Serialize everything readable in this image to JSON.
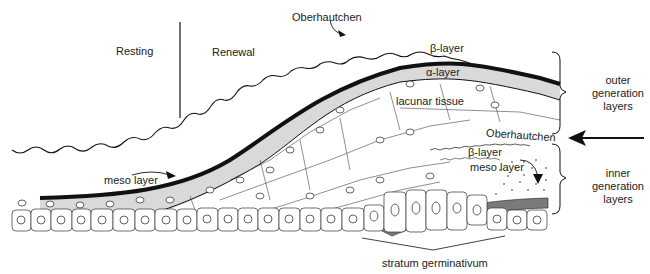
{
  "diagram": {
    "regions": {
      "resting": "Resting",
      "renewal": "Renewal"
    },
    "labels": {
      "oberhautchen_outer": "Oberhautchen",
      "beta_layer_outer": "β-layer",
      "alpha_layer": "α-layer",
      "lacunar_tissue": "lacunar tissue",
      "meso_layer_outer": "meso layer",
      "oberhautchen_inner": "Oberhautchen",
      "beta_layer_inner": "β-layer",
      "meso_layer_inner": "meso layer",
      "stratum_germinativum": "stratum germinativum"
    },
    "brackets": {
      "outer": "outer generation layers",
      "inner": "inner generation layers"
    },
    "colors": {
      "line": "#111111",
      "alpha_fill": "#d9d9d9",
      "inner_meso_fill": "#7a7a7a",
      "background": "#ffffff"
    }
  }
}
